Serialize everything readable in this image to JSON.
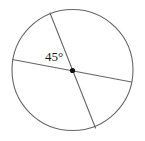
{
  "figure": {
    "kind": "geometry-diagram",
    "background_color": "#ffffff",
    "stroke_color": "#666666",
    "text_color": "#1a1a1a",
    "center_dot_color": "#111111",
    "canvas": {
      "width": 145,
      "height": 141
    }
  },
  "circle": {
    "name": "circle-outline",
    "cx": 72.5,
    "cy": 70.0,
    "r": 60.5,
    "stroke_width": 1.1,
    "fill": "none"
  },
  "center_point": {
    "name": "center-point",
    "cx": 72.5,
    "cy": 70.5,
    "r": 2.6
  },
  "chords": [
    {
      "name": "diameter-shallow",
      "description": "shallow chord from upper-left rim to right rim",
      "x1": 12.5,
      "y1": 59.5,
      "x2": 131.5,
      "y2": 82.0,
      "stroke_width": 1.1
    },
    {
      "name": "diameter-steep",
      "description": "steep chord from top rim to lower-right rim",
      "x1": 50.0,
      "y1": 13.0,
      "x2": 95.5,
      "y2": 128.0,
      "stroke_width": 1.1
    }
  ],
  "labels": {
    "angle": {
      "name": "angle-label-45",
      "text": "45°",
      "value": 45,
      "unit": "degrees",
      "x": 45,
      "y": 50,
      "font_size": 13
    }
  }
}
